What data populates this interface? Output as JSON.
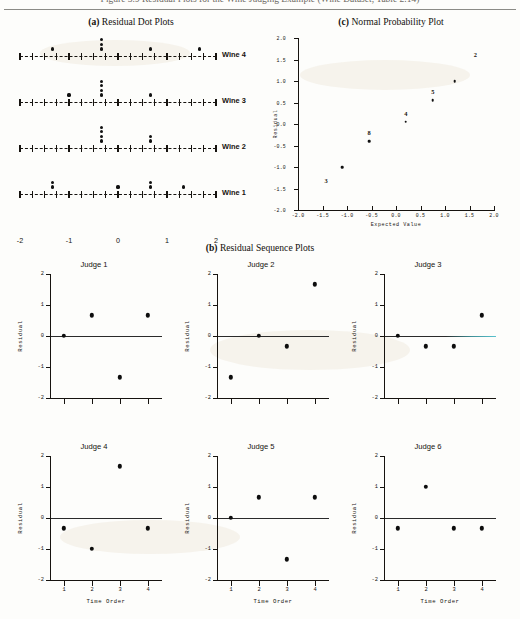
{
  "document": {
    "running_head": "Figure 3.9  Residual Plots for the Wine Judging Example  (Wine Dataset, Table 2.14)"
  },
  "panel_a": {
    "label": "(a)",
    "name": "Residual Dot Plots",
    "axis_ticks": [
      -2,
      -1.75,
      -1.5,
      -1.25,
      -1,
      -0.75,
      -0.5,
      -0.25,
      0,
      0.25,
      0.5,
      0.75,
      1,
      1.25,
      1.5,
      1.75,
      2
    ],
    "axis_tick_labels": [
      "-2",
      "-1",
      "0",
      "1",
      "2"
    ],
    "axis_tick_label_values": [
      -2,
      -1,
      0,
      1,
      2
    ],
    "rows": [
      {
        "label": "Wine 4",
        "values": [
          -1.33,
          -0.33,
          -0.33,
          -0.33,
          0.67,
          1.67
        ]
      },
      {
        "label": "Wine 3",
        "values": [
          -1.0,
          -0.33,
          -0.33,
          -0.33,
          -0.33,
          0.67
        ]
      },
      {
        "label": "Wine 2",
        "values": [
          -0.33,
          -0.33,
          -0.33,
          -0.33,
          0.67,
          0.67
        ]
      },
      {
        "label": "Wine 1",
        "values": [
          -1.33,
          -1.33,
          0.0,
          0.67,
          0.67,
          1.33
        ]
      }
    ]
  },
  "panel_c": {
    "label": "(c)",
    "name": "Normal Probability Plot",
    "xlabel": "Expected Value",
    "ylabel": "Residual",
    "xlim": [
      -2.0,
      2.0
    ],
    "ylim": [
      -2.0,
      2.0
    ],
    "xticks": [
      -2.0,
      -1.5,
      -1.0,
      -0.5,
      0.0,
      0.5,
      1.0,
      1.5,
      2.0
    ],
    "xticklabels": [
      "-2.0",
      "-1.5",
      "-1.0",
      "-0.5",
      "0.0",
      "0.5",
      "1.0",
      "1.5",
      "2.0"
    ],
    "yticks": [
      -2.0,
      -1.5,
      -1.0,
      -0.5,
      0.0,
      0.5,
      1.0,
      1.5,
      2.0
    ],
    "yticklabels": [
      "-2.0",
      "-1.5",
      "-1.0",
      "-0.5",
      "0.0",
      "0.5",
      "1.0",
      "1.5",
      "2.0"
    ],
    "points": [
      {
        "x": -1.1,
        "y": -1.0,
        "label": "3",
        "label_dx": -16,
        "label_dy": 13
      },
      {
        "x": -0.55,
        "y": -0.4,
        "label": "8",
        "label_dx": 0,
        "label_dy": -9
      },
      {
        "x": 0.2,
        "y": 0.05,
        "label": "4",
        "label_dx": 0,
        "label_dy": -9
      },
      {
        "x": 0.75,
        "y": 0.55,
        "label": "5",
        "label_dx": 0,
        "label_dy": -9
      },
      {
        "x": 1.2,
        "y": 1.0,
        "label": "",
        "label_dx": 0,
        "label_dy": 0
      },
      {
        "x": 1.62,
        "y": 1.62,
        "label": "2",
        "label_dx": 0,
        "label_dy": 0
      }
    ]
  },
  "panel_b": {
    "label": "(b)",
    "name": "Residual Sequence Plots",
    "xlabel": "Time Order",
    "ylabel": "Residual",
    "xticks": [
      1,
      2,
      3,
      4
    ],
    "xticklabels": [
      "1",
      "2",
      "3",
      "4"
    ],
    "yticks": [
      -2,
      -1,
      0,
      1,
      2
    ],
    "yticklabels": [
      "-2",
      "-1",
      "0",
      "1",
      "2"
    ],
    "ylim": [
      -2,
      2
    ],
    "subplots": [
      {
        "title": "Judge 1",
        "values": [
          0.0,
          0.67,
          -1.33,
          0.67
        ],
        "show_xaxis_labels": false,
        "tinted_zero": false
      },
      {
        "title": "Judge 2",
        "values": [
          -1.33,
          0.0,
          -0.33,
          1.67
        ],
        "show_xaxis_labels": false,
        "tinted_zero": false
      },
      {
        "title": "Judge 3",
        "values": [
          0.0,
          -0.33,
          -0.33,
          0.67
        ],
        "show_xaxis_labels": false,
        "tinted_zero": true
      },
      {
        "title": "Judge 4",
        "values": [
          -0.33,
          -1.0,
          1.67,
          -0.33
        ],
        "show_xaxis_labels": true,
        "tinted_zero": false
      },
      {
        "title": "Judge 5",
        "values": [
          0.0,
          0.67,
          -1.33,
          0.67
        ],
        "show_xaxis_labels": true,
        "tinted_zero": false
      },
      {
        "title": "Judge 6",
        "values": [
          -0.33,
          1.0,
          -0.33,
          -0.33
        ],
        "show_xaxis_labels": true,
        "tinted_zero": false
      }
    ]
  },
  "chart_data": {
    "type": "scatter",
    "title": "Residual Plots for the Wine Judging Example",
    "panels": [
      {
        "id": "a",
        "type": "dot",
        "title": "(a) Residual Dot Plots",
        "xlabel": "",
        "ylabel": "",
        "xlim": [
          -2,
          2
        ],
        "categories": [
          "Wine 1",
          "Wine 2",
          "Wine 3",
          "Wine 4"
        ],
        "series": [
          {
            "name": "Wine 4",
            "values": [
              -1.33,
              -0.33,
              -0.33,
              -0.33,
              0.67,
              1.67
            ]
          },
          {
            "name": "Wine 3",
            "values": [
              -1.0,
              -0.33,
              -0.33,
              -0.33,
              -0.33,
              0.67
            ]
          },
          {
            "name": "Wine 2",
            "values": [
              -0.33,
              -0.33,
              -0.33,
              -0.33,
              0.67,
              0.67
            ]
          },
          {
            "name": "Wine 1",
            "values": [
              -1.33,
              -1.33,
              0.0,
              0.67,
              0.67,
              1.33
            ]
          }
        ],
        "grid": false,
        "legend": "none"
      },
      {
        "id": "b",
        "type": "scatter",
        "title": "(b) Residual Sequence Plots",
        "xlabel": "Time Order",
        "ylabel": "Residual",
        "x": [
          1,
          2,
          3,
          4
        ],
        "xlim": [
          0.5,
          4.5
        ],
        "ylim": [
          -2,
          2
        ],
        "series": [
          {
            "name": "Judge 1",
            "values": [
              0.0,
              0.67,
              -1.33,
              0.67
            ]
          },
          {
            "name": "Judge 2",
            "values": [
              -1.33,
              0.0,
              -0.33,
              1.67
            ]
          },
          {
            "name": "Judge 3",
            "values": [
              0.0,
              -0.33,
              -0.33,
              0.67
            ]
          },
          {
            "name": "Judge 4",
            "values": [
              -0.33,
              -1.0,
              1.67,
              -0.33
            ]
          },
          {
            "name": "Judge 5",
            "values": [
              0.0,
              0.67,
              -1.33,
              0.67
            ]
          },
          {
            "name": "Judge 6",
            "values": [
              -0.33,
              1.0,
              -0.33,
              -0.33
            ]
          }
        ],
        "grid": false,
        "legend": "none"
      },
      {
        "id": "c",
        "type": "scatter",
        "title": "(c) Normal Probability Plot",
        "xlabel": "Expected Value",
        "ylabel": "Residual",
        "xlim": [
          -2.0,
          2.0
        ],
        "ylim": [
          -2.0,
          2.0
        ],
        "x": [
          -1.1,
          -0.55,
          0.2,
          0.75,
          1.2,
          1.62
        ],
        "values": [
          -1.0,
          -0.4,
          0.05,
          0.55,
          1.0,
          1.62
        ],
        "point_labels": [
          "3",
          "8",
          "4",
          "5",
          "",
          "2"
        ],
        "grid": false,
        "legend": "none"
      }
    ]
  }
}
